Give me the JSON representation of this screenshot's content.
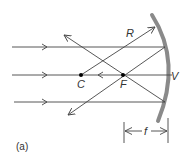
{
  "diagram": {
    "caption": "(a)",
    "labels": {
      "center_of_curvature": "C",
      "focal_point": "F",
      "radius": "R",
      "vertex": "V",
      "focal_length": "f"
    },
    "colors": {
      "mirror": "#8a8a8a",
      "rays": "#444444",
      "points": "#000000"
    }
  }
}
